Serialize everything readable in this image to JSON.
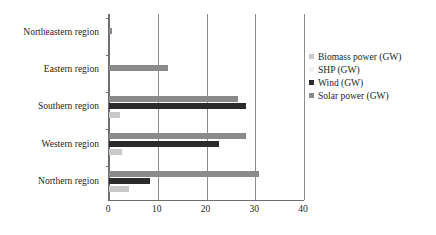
{
  "chart_data": {
    "type": "bar",
    "orientation": "horizontal",
    "title": "",
    "xlabel": "",
    "ylabel": "",
    "xlim": [
      0,
      40
    ],
    "xticks": [
      0,
      10,
      20,
      30,
      40
    ],
    "xtick_labels": [
      "0",
      "10",
      "20",
      "30",
      "40"
    ],
    "grid": true,
    "legend_position": "right",
    "categories": [
      "Northeastern region",
      "Eastern region",
      "Southern region",
      "Western region",
      "Northern region"
    ],
    "series": [
      {
        "name": "Biomass power (GW)",
        "color": "#c9c9c9",
        "values": [
          0,
          0,
          2.3,
          2.6,
          4.0
        ]
      },
      {
        "name": "SHP (GW)",
        "color": "#f2f2f2",
        "values": [
          0,
          0,
          0,
          0,
          0
        ]
      },
      {
        "name": "Wind (GW)",
        "color": "#2b2b2b",
        "values": [
          0,
          0,
          28.0,
          22.5,
          8.5
        ]
      },
      {
        "name": "Solar power (GW)",
        "color": "#8a8a8a",
        "values": [
          0.7,
          12.2,
          26.4,
          28.2,
          30.7
        ]
      }
    ]
  },
  "legend": {
    "items": [
      {
        "label": "Biomass power (GW)",
        "color": "#c9c9c9"
      },
      {
        "label": "SHP (GW)",
        "color": "#f2f2f2"
      },
      {
        "label": "Wind (GW)",
        "color": "#2b2b2b"
      },
      {
        "label": "Solar power (GW)",
        "color": "#8a8a8a"
      }
    ]
  },
  "colors": {
    "axis": "#6e6e6e",
    "gridline": "#8d8d8d",
    "text": "#231f20",
    "background": "#ffffff"
  }
}
